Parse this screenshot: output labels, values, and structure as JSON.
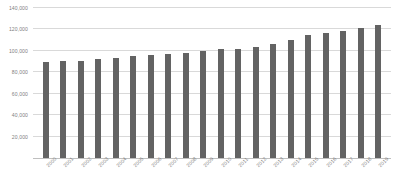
{
  "chart_data": {
    "type": "bar",
    "title": "",
    "xlabel": "",
    "ylabel": "",
    "categories": [
      "2000",
      "2001",
      "2002",
      "2003",
      "2004",
      "2005",
      "2006",
      "2007",
      "2008",
      "2009",
      "2010",
      "2011",
      "2012",
      "2013",
      "2014",
      "2015",
      "2016",
      "2017",
      "2018",
      "2019"
    ],
    "values": [
      90000,
      90200,
      90800,
      92000,
      93000,
      95500,
      95800,
      96800,
      98000,
      100200,
      101500,
      102000,
      103800,
      106800,
      110200,
      114500,
      116500,
      119000,
      121000,
      124500
    ],
    "ylim": [
      0,
      140000
    ],
    "ytick_labels": [
      "20,000",
      "40,000",
      "60,000",
      "80,000",
      "100,000",
      "120,000",
      "140,000"
    ],
    "ytick_values": [
      20000,
      40000,
      60000,
      80000,
      100000,
      120000,
      140000
    ],
    "grid": true,
    "legend": "none",
    "bar_color": "#636363",
    "gridline_color": "#d9d9d9",
    "axis_text_color": "#7f7f7f"
  }
}
